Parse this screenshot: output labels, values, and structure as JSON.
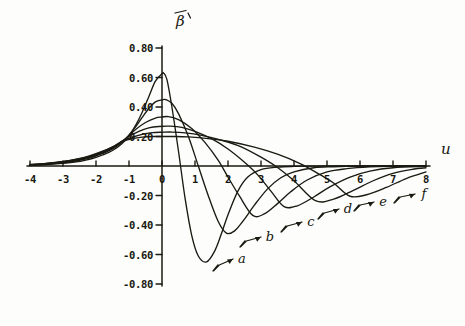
{
  "chart_data": {
    "type": "line",
    "title": "",
    "subtitle": "",
    "xlabel": "u",
    "ylabel": "β̄′",
    "xlim": [
      -4,
      8
    ],
    "ylim": [
      -0.8,
      0.8
    ],
    "grid": false,
    "legend_position": "inline-annotations",
    "x_ticks": [
      "-4",
      "-3",
      "-2",
      "-1",
      "0",
      "1",
      "2",
      "3",
      "4",
      "5",
      "6",
      "7",
      "8"
    ],
    "x_tick_values": [
      -4,
      -3,
      -2,
      -1,
      0,
      1,
      2,
      3,
      4,
      5,
      6,
      7,
      8
    ],
    "y_ticks": [
      "0.80",
      "0.60",
      "0.40",
      "0.20",
      "-0.20",
      "-0.40",
      "-0.60",
      "-0.80"
    ],
    "y_tick_values": [
      0.8,
      0.6,
      0.4,
      0.2,
      -0.2,
      -0.4,
      -0.6,
      -0.8
    ],
    "series": [
      {
        "name": "a",
        "label": "a",
        "peak_x": 0.05,
        "peak_y": 0.63,
        "trough_x": 1.35,
        "trough_y": -0.65,
        "x": [
          -4.0,
          -3.5,
          -3.0,
          -2.6,
          -2.2,
          -1.8,
          -1.5,
          -1.2,
          -1.0,
          -0.8,
          -0.6,
          -0.4,
          -0.2,
          0.0,
          0.05,
          0.15,
          0.3,
          0.5,
          0.7,
          0.9,
          1.1,
          1.35,
          1.6,
          1.8,
          2.0,
          2.3,
          2.6,
          3.0,
          3.5,
          4.0,
          5.0,
          6.0,
          7.0,
          8.0
        ],
        "y": [
          0.005,
          0.01,
          0.018,
          0.028,
          0.045,
          0.075,
          0.105,
          0.155,
          0.205,
          0.275,
          0.365,
          0.47,
          0.575,
          0.625,
          0.63,
          0.585,
          0.4,
          0.1,
          -0.22,
          -0.47,
          -0.61,
          -0.65,
          -0.575,
          -0.46,
          -0.33,
          -0.17,
          -0.075,
          -0.025,
          -0.008,
          -0.003,
          0.0,
          0.0,
          0.0,
          0.0
        ]
      },
      {
        "name": "b",
        "label": "b",
        "peak_x": 0.12,
        "peak_y": 0.45,
        "trough_x": 1.95,
        "trough_y": -0.455,
        "x": [
          -4.0,
          -3.5,
          -3.0,
          -2.6,
          -2.2,
          -1.8,
          -1.5,
          -1.2,
          -1.0,
          -0.8,
          -0.6,
          -0.4,
          -0.2,
          0.0,
          0.12,
          0.3,
          0.5,
          0.8,
          1.1,
          1.4,
          1.7,
          1.95,
          2.2,
          2.5,
          2.8,
          3.2,
          3.6,
          4.0,
          4.6,
          5.2,
          6.0,
          7.0,
          8.0
        ],
        "y": [
          0.006,
          0.012,
          0.022,
          0.034,
          0.053,
          0.085,
          0.115,
          0.165,
          0.21,
          0.265,
          0.33,
          0.39,
          0.435,
          0.448,
          0.45,
          0.425,
          0.355,
          0.2,
          0.0,
          -0.2,
          -0.375,
          -0.455,
          -0.44,
          -0.36,
          -0.265,
          -0.155,
          -0.08,
          -0.04,
          -0.012,
          -0.005,
          -0.001,
          0.0,
          0.0
        ]
      },
      {
        "name": "c",
        "label": "c",
        "peak_x": 0.2,
        "peak_y": 0.335,
        "trough_x": 2.75,
        "trough_y": -0.335,
        "x": [
          -4.0,
          -3.5,
          -3.0,
          -2.6,
          -2.2,
          -1.8,
          -1.5,
          -1.2,
          -1.0,
          -0.8,
          -0.5,
          -0.2,
          0.0,
          0.2,
          0.5,
          0.9,
          1.3,
          1.7,
          2.0,
          2.35,
          2.75,
          3.1,
          3.5,
          3.9,
          4.4,
          5.0,
          5.6,
          6.3,
          7.0,
          8.0
        ],
        "y": [
          0.007,
          0.014,
          0.025,
          0.038,
          0.058,
          0.09,
          0.12,
          0.168,
          0.205,
          0.248,
          0.295,
          0.325,
          0.332,
          0.335,
          0.315,
          0.255,
          0.16,
          0.04,
          -0.075,
          -0.205,
          -0.335,
          -0.325,
          -0.255,
          -0.175,
          -0.095,
          -0.04,
          -0.018,
          -0.006,
          -0.002,
          0.0
        ]
      },
      {
        "name": "d",
        "label": "d",
        "peak_x": 0.25,
        "peak_y": 0.27,
        "trough_x": 3.7,
        "trough_y": -0.275,
        "x": [
          -4.0,
          -3.5,
          -3.0,
          -2.6,
          -2.2,
          -1.8,
          -1.5,
          -1.2,
          -1.0,
          -0.7,
          -0.4,
          -0.1,
          0.25,
          0.6,
          1.0,
          1.5,
          2.0,
          2.5,
          2.9,
          3.3,
          3.7,
          4.1,
          4.6,
          5.1,
          5.7,
          6.3,
          7.0,
          8.0
        ],
        "y": [
          0.008,
          0.015,
          0.027,
          0.041,
          0.062,
          0.094,
          0.125,
          0.17,
          0.2,
          0.235,
          0.258,
          0.268,
          0.27,
          0.262,
          0.235,
          0.185,
          0.115,
          0.025,
          -0.06,
          -0.17,
          -0.275,
          -0.27,
          -0.21,
          -0.14,
          -0.075,
          -0.035,
          -0.012,
          -0.003
        ]
      },
      {
        "name": "e",
        "label": "e",
        "peak_x": 0.3,
        "peak_y": 0.23,
        "trough_x": 4.65,
        "trough_y": -0.235,
        "x": [
          -4.0,
          -3.5,
          -3.0,
          -2.6,
          -2.2,
          -1.8,
          -1.5,
          -1.2,
          -0.9,
          -0.6,
          -0.3,
          0.0,
          0.3,
          0.7,
          1.2,
          1.8,
          2.4,
          3.0,
          3.5,
          4.0,
          4.65,
          5.2,
          5.8,
          6.4,
          7.0,
          7.6,
          8.0
        ],
        "y": [
          0.009,
          0.017,
          0.029,
          0.044,
          0.065,
          0.097,
          0.128,
          0.168,
          0.195,
          0.215,
          0.226,
          0.229,
          0.23,
          0.225,
          0.208,
          0.175,
          0.13,
          0.06,
          -0.01,
          -0.1,
          -0.235,
          -0.225,
          -0.165,
          -0.1,
          -0.05,
          -0.022,
          -0.012
        ]
      },
      {
        "name": "f",
        "label": "f",
        "peak_x": 0.35,
        "peak_y": 0.2,
        "trough_x": 5.7,
        "trough_y": -0.205,
        "x": [
          -4.0,
          -3.5,
          -3.0,
          -2.6,
          -2.2,
          -1.8,
          -1.5,
          -1.2,
          -0.9,
          -0.6,
          -0.3,
          0.0,
          0.35,
          0.8,
          1.4,
          2.0,
          2.8,
          3.5,
          4.2,
          4.8,
          5.2,
          5.7,
          6.2,
          6.8,
          7.4,
          8.0
        ],
        "y": [
          0.01,
          0.018,
          0.031,
          0.046,
          0.068,
          0.1,
          0.13,
          0.166,
          0.185,
          0.196,
          0.2,
          0.2,
          0.2,
          0.197,
          0.186,
          0.168,
          0.128,
          0.08,
          0.015,
          -0.06,
          -0.115,
          -0.205,
          -0.195,
          -0.145,
          -0.085,
          -0.04
        ]
      }
    ],
    "annotations": [
      {
        "name": "a",
        "text": "a",
        "label_x": 242,
        "label_y": 259,
        "arrow_from_x": 213,
        "arrow_from_y": 271,
        "arrow_to_x": 233,
        "arrow_to_y": 259
      },
      {
        "name": "b",
        "text": "b",
        "label_x": 270,
        "label_y": 237,
        "arrow_from_x": 240,
        "arrow_from_y": 247,
        "arrow_to_x": 261,
        "arrow_to_y": 237
      },
      {
        "name": "c",
        "text": "c",
        "label_x": 311,
        "label_y": 222,
        "arrow_from_x": 281,
        "arrow_from_y": 232,
        "arrow_to_x": 302,
        "arrow_to_y": 222
      },
      {
        "name": "d",
        "text": "d",
        "label_x": 348,
        "label_y": 209,
        "arrow_from_x": 318,
        "arrow_from_y": 219,
        "arrow_to_x": 339,
        "arrow_to_y": 209
      },
      {
        "name": "e",
        "text": "e",
        "label_x": 383,
        "label_y": 202,
        "arrow_from_x": 354,
        "arrow_from_y": 211,
        "arrow_to_x": 374,
        "arrow_to_y": 202
      },
      {
        "name": "f",
        "text": "f",
        "label_x": 424,
        "label_y": 194,
        "arrow_from_x": 394,
        "arrow_from_y": 203,
        "arrow_to_x": 415,
        "arrow_to_y": 194
      }
    ]
  },
  "figure": {
    "x_axis_name": "u",
    "y_axis_name_base": "β",
    "y_axis_name_full": "β̄′"
  }
}
